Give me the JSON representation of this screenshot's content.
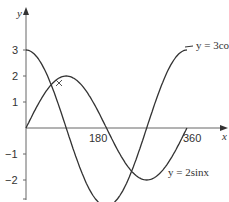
{
  "chart_data": {
    "type": "line",
    "title": "",
    "xlabel": "x",
    "ylabel": "y",
    "x_ticks": [
      180,
      360
    ],
    "y_ticks": [
      3,
      2,
      1,
      -1,
      -2
    ],
    "xlim": [
      0,
      390
    ],
    "ylim": [
      -3,
      4
    ],
    "grid": false,
    "series": [
      {
        "name": "y = 3cosx",
        "function": "3cos(x)",
        "amplitude": 3,
        "x_range": [
          0,
          360
        ]
      },
      {
        "name": "y = 2sinx",
        "function": "2sin(x)",
        "amplitude": 2,
        "x_range": [
          0,
          360
        ]
      }
    ],
    "annotations": [
      {
        "marker": "x",
        "at": "intersection near x≈34, y≈1.7"
      }
    ]
  },
  "labels": {
    "x_axis": "x",
    "y_axis": "y",
    "xt180": "180",
    "xt360": "360",
    "yt3": "3",
    "yt2": "2",
    "yt1": "1",
    "ytm1": "−1",
    "ytm2": "−2",
    "cos_label": "y = 3cosx",
    "sin_label": "y = 2sinx"
  }
}
